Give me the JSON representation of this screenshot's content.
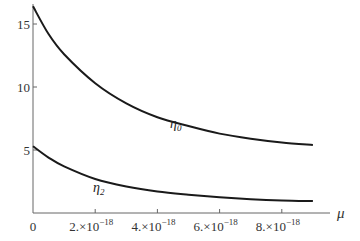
{
  "chart_data": {
    "type": "line",
    "title": "",
    "xlabel": "μ",
    "ylabel": "",
    "xlim": [
      0,
      1e-17
    ],
    "ylim": [
      0,
      17
    ],
    "grid": false,
    "legend": "inline labels",
    "x_ticks": [
      {
        "value": 0,
        "label": "0"
      },
      {
        "value": 2e-18,
        "label": "2.×10",
        "exp": "−18"
      },
      {
        "value": 4e-18,
        "label": "4.×10",
        "exp": "−18"
      },
      {
        "value": 6e-18,
        "label": "6.×10",
        "exp": "−18"
      },
      {
        "value": 8e-18,
        "label": "8.×10",
        "exp": "−18"
      }
    ],
    "y_ticks": [
      {
        "value": 5,
        "label": "5"
      },
      {
        "value": 10,
        "label": "10"
      },
      {
        "value": 15,
        "label": "15"
      }
    ],
    "x": [
      0,
      5e-19,
      1e-18,
      2e-18,
      3e-18,
      4e-18,
      5e-18,
      6e-18,
      7e-18,
      8e-18,
      9e-18
    ],
    "series": [
      {
        "name": "η0",
        "label_main": "η",
        "label_sub": "0",
        "values": [
          16.4,
          14.2,
          12.6,
          10.3,
          8.7,
          7.6,
          6.9,
          6.3,
          5.9,
          5.6,
          5.4
        ]
      },
      {
        "name": "η2",
        "label_main": "η",
        "label_sub": "2",
        "values": [
          5.3,
          4.4,
          3.7,
          2.7,
          2.1,
          1.7,
          1.45,
          1.25,
          1.1,
          1.0,
          0.95
        ]
      }
    ]
  }
}
